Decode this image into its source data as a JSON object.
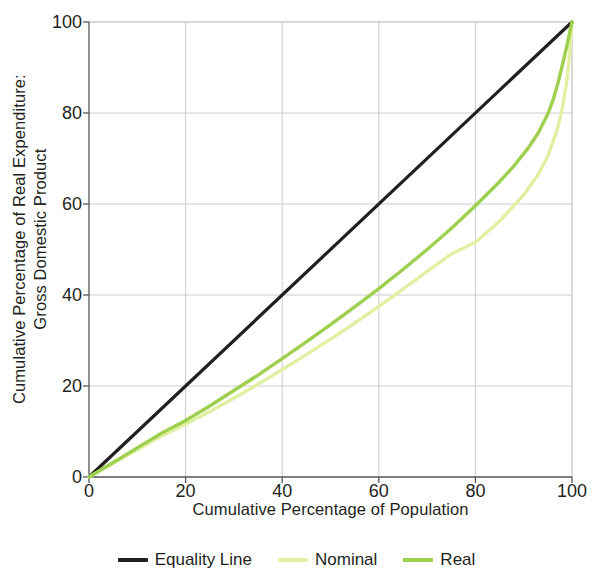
{
  "chart_data": {
    "type": "line",
    "title": "",
    "xlabel": "Cumulative Percentage of Population",
    "ylabel_line1": "Cumulative Percentage of Real Expenditure:",
    "ylabel_line2": "Gross Domestic Product",
    "xlim": [
      0,
      100
    ],
    "ylim": [
      0,
      100
    ],
    "xticks": [
      0,
      20,
      40,
      60,
      80,
      100
    ],
    "yticks": [
      0,
      20,
      40,
      60,
      80,
      100
    ],
    "xtick_labels": [
      "0",
      "20",
      "40",
      "60",
      "80",
      "100"
    ],
    "ytick_labels": [
      "0",
      "20",
      "40",
      "60",
      "80",
      "100"
    ],
    "grid": true,
    "legend_position": "below",
    "series": [
      {
        "name": "Equality Line",
        "color": "#231f20",
        "width": 3.2,
        "x": [
          0,
          100
        ],
        "y": [
          0,
          100
        ]
      },
      {
        "name": "Nominal",
        "color": "#e0f0a3",
        "width": 3.4,
        "x": [
          0,
          5,
          10,
          15,
          20,
          25,
          30,
          35,
          40,
          45,
          50,
          55,
          60,
          65,
          70,
          75,
          80,
          85,
          90,
          93,
          95,
          97,
          98,
          99,
          99.5,
          100
        ],
        "y": [
          0,
          3.0,
          6.0,
          9.0,
          11.6,
          14.4,
          17.3,
          20.4,
          23.6,
          26.9,
          30.3,
          33.8,
          37.5,
          41.3,
          45.2,
          49.0,
          51.6,
          56.2,
          62.0,
          66.5,
          70.5,
          76.5,
          81.0,
          87.5,
          93.0,
          100
        ]
      },
      {
        "name": "Real",
        "color": "#9fcf4f",
        "width": 3.4,
        "x": [
          0,
          5,
          10,
          15,
          20,
          25,
          30,
          35,
          40,
          45,
          50,
          55,
          60,
          65,
          70,
          75,
          80,
          85,
          88,
          91,
          93,
          95,
          96,
          97,
          98,
          99,
          99.5,
          100
        ],
        "y": [
          0,
          3.2,
          6.4,
          9.6,
          12.4,
          15.6,
          19.0,
          22.4,
          26.0,
          29.7,
          33.5,
          37.4,
          41.4,
          45.6,
          50.0,
          54.6,
          59.6,
          64.9,
          68.4,
          72.4,
          75.6,
          79.8,
          82.6,
          86.2,
          90.5,
          95.0,
          97.6,
          100
        ]
      }
    ]
  },
  "legend": {
    "items": [
      {
        "label": "Equality Line",
        "color": "#231f20"
      },
      {
        "label": "Nominal",
        "color": "#e0f0a3"
      },
      {
        "label": "Real",
        "color": "#9fcf4f"
      }
    ]
  },
  "colors": {
    "axis": "#555555",
    "grid": "#cccccc",
    "text": "#231f20",
    "background": "#ffffff"
  }
}
